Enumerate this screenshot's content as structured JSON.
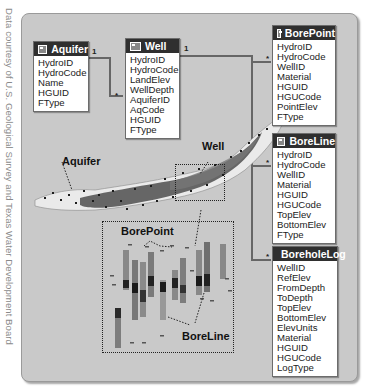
{
  "credit": "Data courtesy of U.S. Geological Survey and Texas Water Development Board",
  "tables": [
    {
      "name": "Aquifer",
      "icon": "feature-class-icon",
      "fields": [
        "HydroID",
        "HydroCode",
        "Name",
        "HGUID",
        "FType"
      ]
    },
    {
      "name": "Well",
      "icon": "feature-class-icon",
      "fields": [
        "HydroID",
        "HydroCode",
        "LandElev",
        "WellDepth",
        "AquiferID",
        "AqCode",
        "HGUID",
        "FType"
      ]
    },
    {
      "name": "BorePoint",
      "icon": "feature-class-icon",
      "fields": [
        "HydroID",
        "HydroCode",
        "WellID",
        "Material",
        "HGUID",
        "HGUCode",
        "PointElev",
        "FType"
      ]
    },
    {
      "name": "BoreLine",
      "icon": "feature-class-icon",
      "fields": [
        "HydroID",
        "HydroCode",
        "WellID",
        "Material",
        "HGUID",
        "HGUCode",
        "TopElev",
        "BottomElev",
        "FType"
      ]
    },
    {
      "name": "BoreholeLog",
      "icon": "table-icon",
      "fields": [
        "WellID",
        "RefElev",
        "FromDepth",
        "ToDepth",
        "TopElev",
        "BottomElev",
        "ElevUnits",
        "Material",
        "HGUID",
        "HGUCode",
        "LogType"
      ]
    }
  ],
  "relationships": [
    {
      "from": "Aquifer",
      "to": "Well",
      "from_card": "1",
      "to_card": "*"
    },
    {
      "from": "Well",
      "to": "BorePoint",
      "from_card": "1",
      "to_card": "*"
    },
    {
      "from": "Well",
      "to": "BoreLine",
      "from_card": "1",
      "to_card": "*"
    },
    {
      "from": "Well",
      "to": "BoreholeLog",
      "from_card": "1",
      "to_card": "*"
    }
  ],
  "map_labels": {
    "aquifer": "Aquifer",
    "well": "Well",
    "borepoint": "BorePoint",
    "boreline": "BoreLine"
  },
  "colors": {
    "frame_bg": "#c9c9c9",
    "header_bg": "#2f2f2f",
    "aquifer_fill": "#e8e8e8",
    "well_dots": "#1a1a1a",
    "connector": "#666666"
  }
}
